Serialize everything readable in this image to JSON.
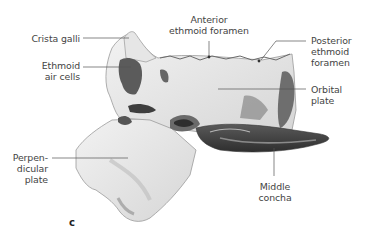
{
  "figure": {
    "panel": "c",
    "labels": {
      "crista_galli": "Crista galli",
      "ethmoid_air_cells": [
        "Ethmoid",
        "air cells"
      ],
      "anterior_ethmoid_foramen": [
        "Anterior",
        "ethmoid foramen"
      ],
      "posterior_ethmoid_foramen": [
        "Posterior",
        "ethmoid",
        "foramen"
      ],
      "orbital_plate": [
        "Orbital",
        "plate"
      ],
      "perpendicular_plate": [
        "Perpen-",
        "dicular",
        "plate"
      ],
      "middle_concha": [
        "Middle",
        "concha"
      ]
    },
    "colors": {
      "bone_light": "#ececec",
      "bone_mid": "#c9c9c9",
      "bone_dark": "#4a4a4a",
      "leader_line": "#555555"
    }
  }
}
